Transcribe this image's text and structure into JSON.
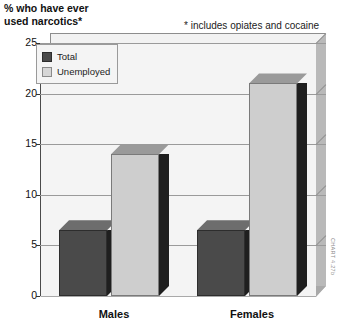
{
  "chart_data": {
    "type": "bar",
    "title": "% who have ever\nused narcotics*",
    "subtitle": "",
    "annotation": "* includes opiates and cocaine",
    "xlabel": "",
    "ylabel": "% who have ever used narcotics*",
    "categories": [
      "Males",
      "Females"
    ],
    "series": [
      {
        "name": "Total",
        "values": [
          6.5,
          6.5
        ],
        "color": "#4a4a4a"
      },
      {
        "name": "Unemployed",
        "values": [
          14.0,
          21.0
        ],
        "color": "#cecece"
      }
    ],
    "ylim": [
      0,
      25
    ],
    "yticks": [
      0,
      5,
      10,
      15,
      20,
      25
    ],
    "ytick_labels": [
      "0",
      "5",
      "10",
      "15",
      "20",
      "25"
    ],
    "grid": true,
    "legend_position": "top-left",
    "style_3d": true
  },
  "legend": {
    "items": [
      {
        "label": "Total",
        "swatch": "total"
      },
      {
        "label": "Unemployed",
        "swatch": "unemployed"
      }
    ]
  },
  "credit": {
    "text": "CHART 4.27b"
  },
  "colors": {
    "total": "#4a4a4a",
    "unemployed": "#cecece",
    "plot_background": "#f4f4f4",
    "gridline": "#9a9a9a",
    "axis": "#333333"
  }
}
